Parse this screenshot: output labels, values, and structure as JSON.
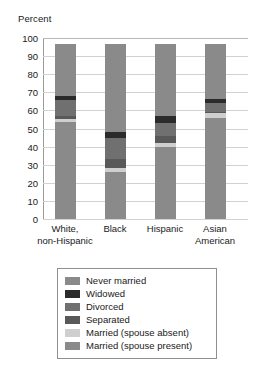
{
  "chart_data": {
    "type": "bar",
    "subtype": "stacked-bar",
    "title": "",
    "xlabel": "",
    "ylabel": "Percent",
    "ylim": [
      0,
      100
    ],
    "grid": true,
    "legend_position": "bottom",
    "categories": [
      "White,\nnon-Hispanic",
      "Black",
      "Hispanic",
      "Asian\nAmerican"
    ],
    "y_ticks": [
      "100",
      "90",
      "80",
      "70",
      "60",
      "50",
      "40",
      "30",
      "20",
      "10",
      "0"
    ],
    "series": [
      {
        "name": "Married (spouse present)",
        "color": "#8a8a8a",
        "values": [
          53.5,
          26.0,
          40.0,
          56.0
        ]
      },
      {
        "name": "Married (spouse absent)",
        "color": "#cfcfcf",
        "values": [
          2.0,
          2.0,
          2.0,
          2.5
        ]
      },
      {
        "name": "Separated",
        "color": "#595959",
        "values": [
          1.5,
          5.0,
          4.0,
          0.5
        ]
      },
      {
        "name": "Divorced",
        "color": "#707070",
        "values": [
          9.0,
          11.5,
          7.0,
          5.0
        ]
      },
      {
        "name": "Widowed",
        "color": "#2b2b2b",
        "values": [
          2.0,
          3.5,
          4.0,
          2.5
        ]
      },
      {
        "name": "Never married",
        "color": "#8a8a8a",
        "values": [
          28.5,
          48.5,
          39.5,
          30.0
        ]
      }
    ],
    "legend_entries": [
      {
        "label": "Never married",
        "color": "#8a8a8a"
      },
      {
        "label": "Widowed",
        "color": "#2b2b2b"
      },
      {
        "label": "Divorced",
        "color": "#707070"
      },
      {
        "label": "Separated",
        "color": "#595959"
      },
      {
        "label": "Married (spouse absent)",
        "color": "#cfcfcf"
      },
      {
        "label": "Married (spouse present)",
        "color": "#8a8a8a"
      }
    ]
  }
}
